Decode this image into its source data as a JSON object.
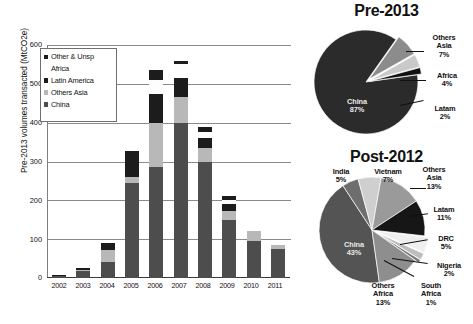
{
  "chart_data": [
    {
      "type": "bar",
      "stacked": true,
      "title": "",
      "xlabel": "",
      "ylabel": "Pre-2013 volumes transacted (MtCO2e)",
      "ylim": [
        0,
        600
      ],
      "yticks": [
        0,
        100,
        200,
        300,
        400,
        500,
        600
      ],
      "grid": true,
      "legend_position": "upper-left",
      "categories": [
        "2002",
        "2003",
        "2004",
        "2005",
        "2006",
        "2007",
        "2008",
        "2009",
        "2010",
        "2011"
      ],
      "series": [
        {
          "name": "China",
          "color": "#4d4d4d",
          "values": [
            5,
            18,
            42,
            245,
            285,
            400,
            300,
            150,
            95,
            75
          ]
        },
        {
          "name": "Others Asia",
          "color": "#b8b8b8",
          "values": [
            0,
            2,
            30,
            15,
            115,
            65,
            35,
            22,
            25,
            10
          ]
        },
        {
          "name": "Latin America",
          "color": "#1c1c1c",
          "values": [
            3,
            6,
            18,
            68,
            75,
            50,
            25,
            18,
            0,
            0
          ]
        },
        {
          "name": "Africa",
          "color": "#fdfdfd",
          "values": [
            0,
            0,
            0,
            0,
            35,
            35,
            15,
            10,
            0,
            0
          ]
        },
        {
          "name": "Other & Unsp",
          "color": "#1c1c1c",
          "values": [
            0,
            0,
            0,
            0,
            25,
            10,
            15,
            10,
            0,
            0
          ]
        }
      ],
      "legend_entries": [
        "Other & Unsp",
        "Africa",
        "Latin America",
        "Others Asia",
        "China"
      ]
    },
    {
      "type": "pie",
      "title": "Pre-2013",
      "labels": [
        "China",
        "Others Asia",
        "Africa",
        "Latam"
      ],
      "values": [
        87,
        7,
        4,
        2
      ],
      "display_labels": [
        "China\n87%",
        "Others\nAsia\n7%",
        "Africa\n4%",
        "Latam\n2%"
      ],
      "colors": [
        "#2b2b2b",
        "#8c8c8c",
        "#c9c9c9",
        "#111111"
      ]
    },
    {
      "type": "pie",
      "title": "Post-2012",
      "labels": [
        "China",
        "India",
        "Vietnam",
        "Others Asia",
        "Latam",
        "DRC",
        "Nigeria",
        "South Africa",
        "Others Africa"
      ],
      "values": [
        43,
        5,
        7,
        13,
        11,
        5,
        2,
        1,
        13
      ],
      "display_labels": [
        "China\n43%",
        "India\n5%",
        "Vietnam\n7%",
        "Others\nAsia\n13%",
        "Latam\n11%",
        "DRC\n5%",
        "Nigeria\n2%",
        "South\nAfrica\n1%",
        "Others\nAfrica\n13%"
      ],
      "colors": [
        "#545454",
        "#6e6e6e",
        "#cfcfcf",
        "#9a9a9a",
        "#161616",
        "#efefef",
        "#bdbdbd",
        "#7a7a7a",
        "#8e8e8e"
      ]
    }
  ],
  "bar_chart": {
    "ylabel": "Pre-2013 volumes transacted (MtCO2e)",
    "yticks": [
      "600",
      "500",
      "400",
      "300",
      "200",
      "100",
      "0"
    ],
    "xticks": [
      "2002",
      "2003",
      "2004",
      "2005",
      "2006",
      "2007",
      "2008",
      "2009",
      "2010",
      "2011"
    ],
    "legend": [
      {
        "label": "Other & Unsp",
        "swatch": "#1c1c1c",
        "has_swatch": true
      },
      {
        "label": "Africa",
        "swatch": "#ffffff",
        "has_swatch": false
      },
      {
        "label": "Latin America",
        "swatch": "#1c1c1c",
        "has_swatch": true
      },
      {
        "label": "Others Asia",
        "swatch": "#b8b8b8",
        "has_swatch": true
      },
      {
        "label": "China",
        "swatch": "#4d4d4d",
        "has_swatch": true
      }
    ]
  },
  "pie_pre2013": {
    "title": "Pre-2013",
    "labels": {
      "china": "China\n87%",
      "others_asia": "Others\nAsia\n7%",
      "africa": "Africa\n4%",
      "latam": "Latam\n2%"
    }
  },
  "pie_post2012": {
    "title": "Post-2012",
    "labels": {
      "china": "China\n43%",
      "india": "India\n5%",
      "vietnam": "Vietnam\n7%",
      "others_asia": "Others\nAsia\n13%",
      "latam": "Latam\n11%",
      "drc": "DRC\n5%",
      "nigeria": "Nigeria\n2%",
      "south_africa": "South\nAfrica\n1%",
      "others_africa": "Others\nAfrica\n13%"
    }
  }
}
